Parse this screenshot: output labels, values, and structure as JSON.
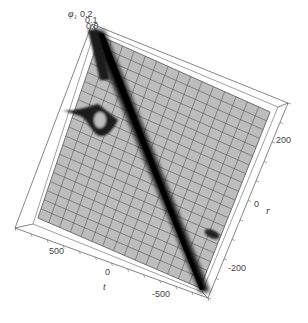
{
  "chart_data": {
    "type": "surface3d",
    "title": "",
    "zlabel": "φ₁",
    "xlabel": "t",
    "ylabel": "r",
    "z_ticks": [
      "0.2",
      "0.1",
      "0.0"
    ],
    "t_ticks": [
      "500",
      "0",
      "-500"
    ],
    "r_ticks": [
      "200",
      "0",
      "-200"
    ],
    "t_range": [
      -750,
      750
    ],
    "r_range": [
      -300,
      300
    ],
    "z_range": [
      0,
      0.2
    ],
    "mesh": {
      "t_lines": 15,
      "r_lines": 20
    },
    "features": [
      {
        "name": "main-ridge",
        "description": "dark diagonal band from (t=-750,r=-300) corner to (t=750,r=300) corner"
      },
      {
        "name": "secondary-bump-left",
        "description": "small dark loop near t≈400, r≈100"
      },
      {
        "name": "secondary-bump-right",
        "description": "small dark blob near t≈-300, r≈-150"
      }
    ],
    "colors": {
      "surface": "#b8b8b8",
      "mesh": "#555555",
      "ridge": "#111111",
      "box": "#666666"
    }
  },
  "labels": {
    "z_axis": "φ₁",
    "z_tick_top": "0.2",
    "z_tick_mid": "0.1",
    "z_tick_low": "0.0",
    "t_axis": "t",
    "t_tick_500": "500",
    "t_tick_0": "0",
    "t_tick_m500": "-500",
    "r_axis": "r",
    "r_tick_200": "200",
    "r_tick_0": "0",
    "r_tick_m200": "-200"
  }
}
